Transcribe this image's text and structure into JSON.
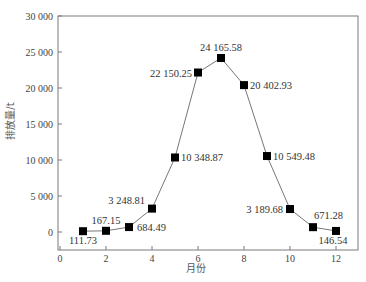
{
  "chart_data": {
    "type": "line",
    "title": "",
    "xlabel": "月份",
    "ylabel": "排放量/t",
    "x": [
      1,
      2,
      3,
      4,
      5,
      6,
      7,
      8,
      9,
      10,
      11,
      12
    ],
    "series": [
      {
        "name": "排放量",
        "values": [
          111.73,
          167.15,
          684.49,
          3248.81,
          10348.87,
          22150.25,
          24165.58,
          20402.93,
          10549.48,
          3189.68,
          671.28,
          146.54
        ],
        "labels": [
          "111.73",
          "167.15",
          "684.49",
          "3 248.81",
          "10 348.87",
          "22 150.25",
          "24 165.58",
          "20 402.93",
          "10 549.48",
          "3 189.68",
          "671.28",
          "146.54"
        ],
        "marker": "square",
        "color": "#000000"
      }
    ],
    "xlim": [
      0,
      12.9
    ],
    "ylim": [
      -2500,
      30000
    ],
    "xticks": [
      0,
      2,
      4,
      6,
      8,
      10,
      12
    ],
    "xtick_labels": [
      "0",
      "2",
      "4",
      "6",
      "8",
      "10",
      "12"
    ],
    "yticks": [
      0,
      5000,
      10000,
      15000,
      20000,
      25000,
      30000
    ],
    "ytick_labels": [
      "0",
      "5 000",
      "10 000",
      "15 000",
      "20 000",
      "25 000",
      "30 000"
    ],
    "grid": false,
    "legend": null
  },
  "colors": {
    "axis": "#7a7a7a",
    "line": "#777777",
    "marker": "#000000"
  }
}
